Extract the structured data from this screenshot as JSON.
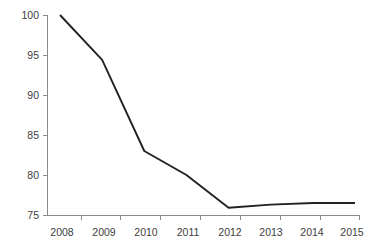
{
  "chart_data": {
    "type": "line",
    "title": "",
    "subtitle": "",
    "xlabel": "",
    "ylabel": "",
    "categories": [
      "2008",
      "2009",
      "2010",
      "2011",
      "2012",
      "2013",
      "2014",
      "2015"
    ],
    "values": [
      100,
      94.4,
      83,
      80,
      75.9,
      76.3,
      76.5,
      76.5
    ],
    "series": [
      {
        "name": "",
        "values": [
          100,
          94.4,
          83,
          80,
          75.9,
          76.3,
          76.5,
          76.5
        ]
      }
    ],
    "x": [
      2008,
      2009,
      2010,
      2011,
      2012,
      2013,
      2014,
      2015
    ],
    "ylim": [
      75,
      100
    ],
    "y_ticks": [
      75,
      80,
      85,
      90,
      95,
      100
    ],
    "y_tick_labels": [
      "75",
      "80",
      "85",
      "90",
      "95",
      "100"
    ],
    "x_tick_labels": [
      "2008",
      "2009",
      "2010",
      "2011",
      "2012",
      "2013",
      "2014",
      "2015"
    ],
    "grid": false,
    "legend": false,
    "legend_position": "none",
    "markers": false,
    "annotations": [],
    "colors": {
      "line": "#222222",
      "axis": "#8a8a8a",
      "label": "#3d3d3d",
      "background": "#ffffff"
    }
  }
}
